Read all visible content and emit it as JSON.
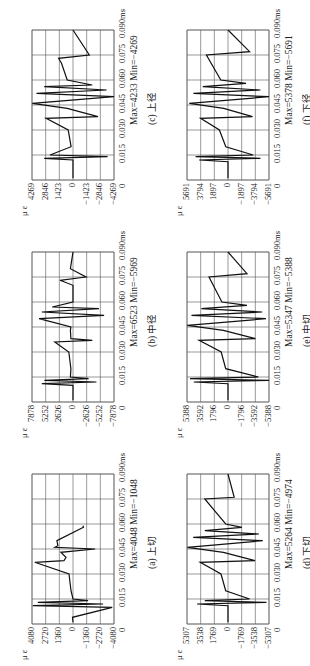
{
  "chart_data": [
    {
      "id": "a",
      "type": "line",
      "caption": "(a) 上切",
      "ylabel": "μ ε",
      "xlabel_unit": "ms",
      "y_ticks": [
        "4080",
        "2720",
        "1360",
        "0",
        "-1360",
        "-2720",
        "-4080"
      ],
      "x_ticks": [
        "0",
        "0.015",
        "0.030",
        "0.045",
        "0.060",
        "0.075",
        "0.090ms"
      ],
      "ylim": [
        -4080,
        4080
      ],
      "xlim": [
        0,
        0.09
      ],
      "stats": "Max=4048 Min=-1048",
      "series": [
        {
          "name": "strain",
          "x": [
            0.001,
            0.004,
            0.01,
            0.011,
            0.012,
            0.013,
            0.014,
            0.015,
            0.02,
            0.03,
            0.037,
            0.038,
            0.04,
            0.043,
            0.045,
            0.046,
            0.047,
            0.05,
            0.058,
            0.059
          ],
          "y": [
            0,
            50,
            -3900,
            4000,
            -3000,
            3500,
            -1500,
            0,
            200,
            400,
            3800,
            900,
            700,
            1200,
            -2200,
            1800,
            1500,
            1600,
            -1048,
            -1000
          ]
        }
      ]
    },
    {
      "id": "b",
      "type": "line",
      "caption": "(b) 中径",
      "ylabel": "μ ε",
      "xlabel_unit": "ms",
      "y_ticks": [
        "7878",
        "5252",
        "2626",
        "0",
        "-2626",
        "-5252",
        "-7878"
      ],
      "x_ticks": [
        "0",
        "0.015",
        "0.030",
        "0.045",
        "0.060",
        "0.075",
        "0.090ms"
      ],
      "ylim": [
        -7878,
        7878
      ],
      "xlim": [
        0,
        0.09
      ],
      "stats": "Max=6523 Min=-5969",
      "series": [
        {
          "name": "strain",
          "x": [
            0.001,
            0.01,
            0.011,
            0.012,
            0.013,
            0.014,
            0.015,
            0.02,
            0.03,
            0.036,
            0.037,
            0.038,
            0.043,
            0.045,
            0.05,
            0.052,
            0.054,
            0.056,
            0.057,
            0.06,
            0.07,
            0.073,
            0.075,
            0.08,
            0.09
          ],
          "y": [
            0,
            0,
            6000,
            -4500,
            5500,
            -3000,
            500,
            400,
            800,
            3500,
            -3700,
            400,
            500,
            400,
            6523,
            -5969,
            6000,
            -5000,
            4000,
            0,
            0,
            2500,
            -2500,
            500,
            0
          ]
        }
      ]
    },
    {
      "id": "c",
      "type": "line",
      "caption": "(c) 上径",
      "ylabel": "μ ε",
      "xlabel_unit": "ms",
      "y_ticks": [
        "4269",
        "2846",
        "1423",
        "0",
        "-1423",
        "-2846",
        "-4269"
      ],
      "x_ticks": [
        "0",
        "0.015",
        "0.030",
        "0.045",
        "0.060",
        "0.075",
        "0.090ms"
      ],
      "ylim": [
        -4269,
        4269
      ],
      "xlim": [
        0,
        0.09
      ],
      "stats": "Max=4233 Min=-4269",
      "series": [
        {
          "name": "strain",
          "x": [
            0.001,
            0.012,
            0.013,
            0.014,
            0.015,
            0.02,
            0.03,
            0.037,
            0.038,
            0.043,
            0.046,
            0.05,
            0.052,
            0.054,
            0.056,
            0.057,
            0.06,
            0.07,
            0.073,
            0.075,
            0.09
          ],
          "y": [
            0,
            0,
            3000,
            -3600,
            2400,
            200,
            500,
            2800,
            -2600,
            600,
            4233,
            -4269,
            3800,
            -3500,
            3000,
            -2000,
            600,
            1200,
            1500,
            -1700,
            0
          ]
        }
      ]
    },
    {
      "id": "d",
      "type": "line",
      "caption": "(d) 下切",
      "ylabel": "μ ε",
      "xlabel_unit": "ms",
      "y_ticks": [
        "5307",
        "3538",
        "1769",
        "0",
        "-1769",
        "-3538",
        "-5307"
      ],
      "x_ticks": [
        "0",
        "0.015",
        "0.030",
        "0.045",
        "0.060",
        "0.075",
        "0.090ms"
      ],
      "ylim": [
        -5307,
        5307
      ],
      "xlim": [
        0,
        0.09
      ],
      "stats": "Max=5264 Min=-4974",
      "series": [
        {
          "name": "strain",
          "x": [
            0.001,
            0.011,
            0.012,
            0.013,
            0.014,
            0.015,
            0.02,
            0.03,
            0.037,
            0.038,
            0.043,
            0.046,
            0.05,
            0.052,
            0.054,
            0.056,
            0.058,
            0.06,
            0.075,
            0.076,
            0.09
          ],
          "y": [
            0,
            0,
            4000,
            -4974,
            3000,
            -2800,
            300,
            900,
            3600,
            -3500,
            600,
            5264,
            -4500,
            4500,
            -4000,
            3000,
            -1800,
            300,
            3000,
            -800,
            0
          ]
        }
      ]
    },
    {
      "id": "e",
      "type": "line",
      "caption": "(e) 中切",
      "ylabel": "μ ε",
      "xlabel_unit": "ms",
      "y_ticks": [
        "5388",
        "3592",
        "1796",
        "0",
        "-1796",
        "-3592",
        "-5388"
      ],
      "x_ticks": [
        "0",
        "0.015",
        "0.030",
        "0.045",
        "0.060",
        "0.075",
        "0.090ms"
      ],
      "ylim": [
        -5388,
        5388
      ],
      "xlim": [
        0,
        0.09
      ],
      "stats": "Max=5347 Min=-5388",
      "series": [
        {
          "name": "strain",
          "x": [
            0.001,
            0.011,
            0.012,
            0.013,
            0.014,
            0.015,
            0.02,
            0.03,
            0.037,
            0.038,
            0.043,
            0.046,
            0.05,
            0.052,
            0.054,
            0.056,
            0.058,
            0.06,
            0.075,
            0.077,
            0.09
          ],
          "y": [
            0,
            0,
            4500,
            -5388,
            5000,
            -4000,
            300,
            900,
            3800,
            -3600,
            600,
            5347,
            -5000,
            4800,
            -4500,
            3500,
            -2500,
            800,
            2500,
            -2500,
            0
          ]
        }
      ]
    },
    {
      "id": "f",
      "type": "line",
      "caption": "(f) 下径",
      "ylabel": "μ ε",
      "xlabel_unit": "ms",
      "y_ticks": [
        "5691",
        "3794",
        "1897",
        "0",
        "-1897",
        "-3794",
        "-5691"
      ],
      "x_ticks": [
        "0",
        "0.015",
        "0.030",
        "0.045",
        "0.060",
        "0.075",
        "0.090ms"
      ],
      "ylim": [
        -5691,
        5691
      ],
      "xlim": [
        0,
        0.09
      ],
      "stats": "Max=5378 Min=-5691",
      "series": [
        {
          "name": "strain",
          "x": [
            0.001,
            0.011,
            0.012,
            0.013,
            0.014,
            0.015,
            0.02,
            0.03,
            0.037,
            0.038,
            0.043,
            0.046,
            0.05,
            0.052,
            0.054,
            0.056,
            0.058,
            0.06,
            0.075,
            0.077,
            0.09
          ],
          "y": [
            0,
            0,
            4000,
            -4500,
            4500,
            -3500,
            300,
            1200,
            3800,
            -3400,
            600,
            5378,
            -5691,
            4800,
            -4500,
            3500,
            -2500,
            1000,
            3000,
            -3000,
            0
          ]
        }
      ]
    }
  ]
}
